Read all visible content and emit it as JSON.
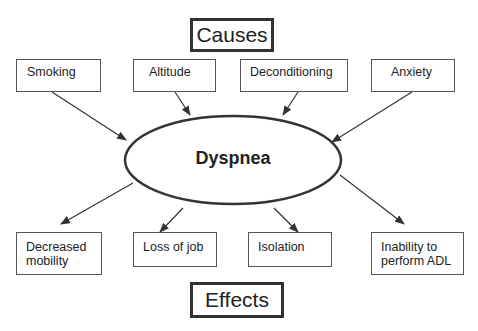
{
  "diagram": {
    "causes_title": "Causes",
    "effects_title": "Effects",
    "center": "Dyspnea",
    "causes": [
      {
        "label": "Smoking"
      },
      {
        "label": "Altitude"
      },
      {
        "label": "Deconditioning"
      },
      {
        "label": "Anxiety"
      }
    ],
    "effects": [
      {
        "line1": "Decreased",
        "line2": "mobility"
      },
      {
        "line1": "Loss of job",
        "line2": ""
      },
      {
        "line1": "Isolation",
        "line2": ""
      },
      {
        "line1": "Inability to",
        "line2": "perform ADL"
      }
    ],
    "colors": {
      "stroke": "#333333",
      "background": "#ffffff"
    }
  }
}
